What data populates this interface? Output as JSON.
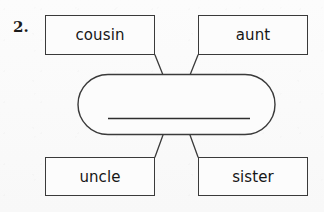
{
  "worksheet": {
    "item_number": "2.",
    "center_shape": {
      "shape": "rounded-rectangle",
      "answer_line": "",
      "answer_placeholder": ""
    },
    "boxes": [
      {
        "id": "cousin",
        "label": "cousin",
        "position": "top-left"
      },
      {
        "id": "aunt",
        "label": "aunt",
        "position": "top-right"
      },
      {
        "id": "uncle",
        "label": "uncle",
        "position": "bottom-left"
      },
      {
        "id": "sister",
        "label": "sister",
        "position": "bottom-right"
      }
    ],
    "colors": {
      "background": "#fbfbfb",
      "stroke": "#3a3a3a",
      "text": "#161616",
      "answer_line": "#2e2e2e"
    },
    "icons": {
      "connector": "connector-line-icon",
      "answer_line": "answer-line-icon"
    }
  }
}
